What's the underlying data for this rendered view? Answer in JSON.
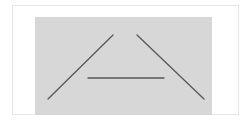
{
  "figure": {
    "background_color": "#ffffff",
    "frame_border_color": "#e6e6e6",
    "panel_color": "#d7d7d7",
    "line_color": "#575757",
    "lines": [
      {
        "name": "left-diagonal-line",
        "x1": 48,
        "y1": 99,
        "x2": 113,
        "y2": 35
      },
      {
        "name": "right-diagonal-line",
        "x1": 137,
        "y1": 35,
        "x2": 204,
        "y2": 99
      },
      {
        "name": "horizontal-line",
        "x1": 88,
        "y1": 78,
        "x2": 164,
        "y2": 78
      }
    ]
  }
}
